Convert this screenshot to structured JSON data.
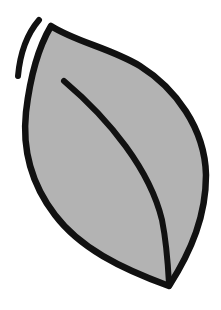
{
  "illustration": {
    "subject": "leaf",
    "label": "Leaf icon",
    "colors": {
      "fill": "#b3b3b3",
      "stroke": "#111111",
      "background": "#ffffff"
    },
    "parts": [
      "leaf-body",
      "midrib",
      "motion-line"
    ]
  }
}
